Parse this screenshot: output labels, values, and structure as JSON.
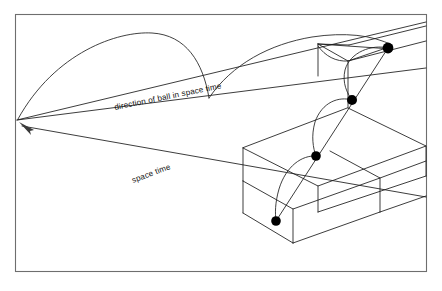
{
  "figure": {
    "background_color": "#ffffff",
    "line_color": "#1a1a1a",
    "frame_color": "#6e6e6e",
    "ball_color": "#000000",
    "frame": {
      "x": 15,
      "y": 14,
      "width": 412,
      "height": 258
    },
    "vanishing_point": {
      "x": 17,
      "y": 120
    },
    "labels": [
      {
        "id": "direction-label",
        "text": "direction of ball in space time",
        "x": 115,
        "y": 110,
        "rotation": -11.5
      },
      {
        "id": "spacetime-label",
        "text": "space time",
        "x": 133,
        "y": 183,
        "rotation": -20.5
      }
    ],
    "balls": [
      {
        "id": "ball-1",
        "cx": 388,
        "cy": 48,
        "r": 5.4
      },
      {
        "id": "ball-2",
        "cx": 352,
        "cy": 100,
        "r": 5.0
      },
      {
        "id": "ball-3",
        "cx": 316,
        "cy": 156,
        "r": 4.8
      },
      {
        "id": "ball-4",
        "cx": 276,
        "cy": 221,
        "r": 4.8
      }
    ],
    "arrow": {
      "id": "space-time-arrow",
      "tip_x": 20,
      "tip_y": 124,
      "points": "20,124 33,129 29,133"
    },
    "horizon_lines": [
      {
        "id": "horizon-upper",
        "x1": 17,
        "y1": 120,
        "x2": 442,
        "y2": 23
      },
      {
        "id": "horizon-lower",
        "x1": 17,
        "y1": 120,
        "x2": 442,
        "y2": 68
      },
      {
        "id": "ground-ray",
        "x1": 22,
        "y1": 126,
        "x2": 442,
        "y2": 196
      }
    ],
    "steps": {
      "top_step": "318,44 345,60 442,35 442,22 349,45",
      "mid_step": "243,148 318,187 442,143 442,95 331,86 243,112",
      "low_step": "243,183 293,209 380,263 442,232 442,196 380,228 293,177"
    },
    "ball_count": 4,
    "bounce_count": 4
  }
}
